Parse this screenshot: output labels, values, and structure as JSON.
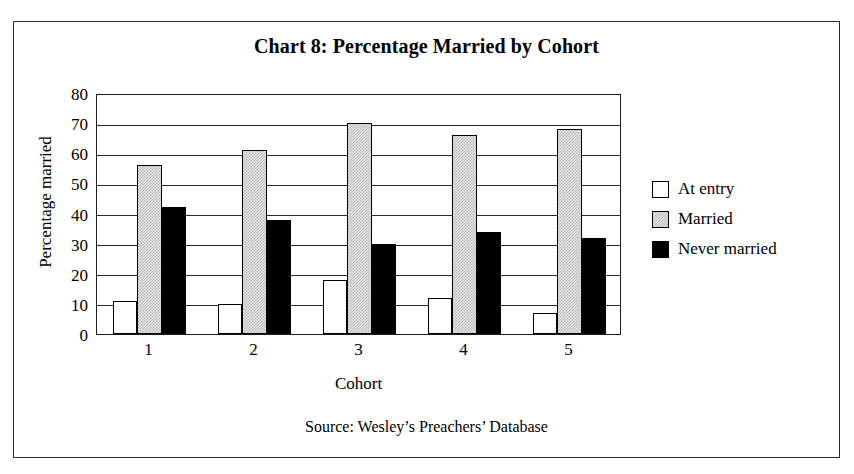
{
  "frame": {
    "border_color": "#2b2b2b",
    "background": "#ffffff"
  },
  "title": "Chart 8: Percentage Married by Cohort",
  "source_note": "Source: Wesley’s Preachers’ Database",
  "legend": {
    "position": "right",
    "entries": [
      {
        "label": "At entry",
        "swatch": "white-outlined-square",
        "color": "#ffffff"
      },
      {
        "label": "Married",
        "swatch": "light-gray-dotted-square",
        "color": "#d8d8d8"
      },
      {
        "label": "Never married",
        "swatch": "black-filled-square",
        "color": "#000000"
      }
    ]
  },
  "chart_data": {
    "type": "bar",
    "title": "Chart 8: Percentage Married by Cohort",
    "xlabel": "Cohort",
    "ylabel": "Percentage married",
    "categories": [
      "1",
      "2",
      "3",
      "4",
      "5"
    ],
    "series": [
      {
        "name": "At entry",
        "color": "#ffffff",
        "values": [
          11,
          10,
          18,
          12,
          7
        ]
      },
      {
        "name": "Married",
        "color": "#d8d8d8",
        "values": [
          56,
          61,
          70,
          66,
          68
        ]
      },
      {
        "name": "Never married",
        "color": "#000000",
        "values": [
          42,
          38,
          30,
          34,
          32
        ]
      }
    ],
    "ylim": [
      0,
      80
    ],
    "ytick_step": 10,
    "yticks": [
      0,
      10,
      20,
      30,
      40,
      50,
      60,
      70,
      80
    ],
    "grid": true,
    "grid_axis": "y",
    "legend_position": "right"
  }
}
